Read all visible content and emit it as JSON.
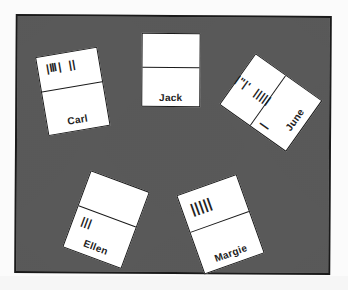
{
  "figure": {
    "table_color": "#c8c8c8",
    "border_color": "#1a1a1a"
  },
  "cards": [
    {
      "name": "Carl",
      "tally_top": "|Ⅲ|  ||",
      "tally_bottom": "",
      "count_label": "6"
    },
    {
      "name": "Jack",
      "tally_top": "",
      "tally_bottom": "",
      "count_label": "0"
    },
    {
      "name": "June",
      "tally_top": "|ʺ|ʹ  |||||",
      "tally_bottom": "|",
      "count_label": "10"
    },
    {
      "name": "Ellen",
      "tally_top": "",
      "tally_bottom": "|||",
      "count_label": "3"
    },
    {
      "name": "Margie",
      "tally_top": "|||||",
      "tally_bottom": "",
      "count_label": "5"
    }
  ]
}
